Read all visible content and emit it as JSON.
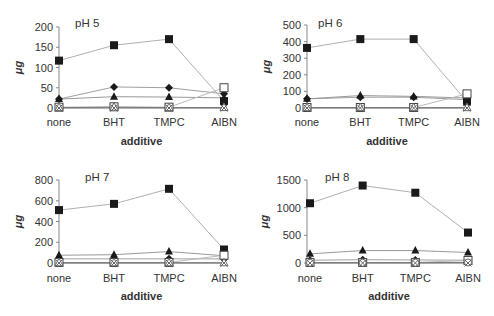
{
  "chart_data": [
    {
      "type": "line",
      "title": "pH 5",
      "xlabel": "additive",
      "ylabel": "μg",
      "categories": [
        "none",
        "BHT",
        "TMPC",
        "AIBN"
      ],
      "yticks": [
        0,
        50,
        100,
        150,
        200
      ],
      "ylim": [
        0,
        200
      ],
      "series": [
        {
          "name": "filled-square",
          "marker": "square-filled",
          "values": [
            117,
            155,
            170,
            17
          ]
        },
        {
          "name": "filled-diamond",
          "marker": "diamond-filled",
          "values": [
            22,
            52,
            50,
            35
          ]
        },
        {
          "name": "filled-triangle",
          "marker": "triangle-filled",
          "values": [
            22,
            28,
            27,
            25
          ]
        },
        {
          "name": "open-square",
          "marker": "square-open",
          "values": [
            2,
            3,
            2,
            50
          ]
        },
        {
          "name": "open-triangle",
          "marker": "triangle-open",
          "values": [
            1,
            2,
            1,
            1
          ]
        },
        {
          "name": "cross",
          "marker": "x",
          "values": [
            0,
            0,
            0,
            0
          ]
        }
      ]
    },
    {
      "type": "line",
      "title": "pH 6",
      "xlabel": "additive",
      "ylabel": "μg",
      "categories": [
        "none",
        "BHT",
        "TMPC",
        "AIBN"
      ],
      "yticks": [
        0,
        100,
        200,
        300,
        400,
        500
      ],
      "ylim": [
        0,
        500
      ],
      "series": [
        {
          "name": "filled-square",
          "marker": "square-filled",
          "values": [
            362,
            415,
            415,
            38
          ]
        },
        {
          "name": "filled-diamond",
          "marker": "diamond-filled",
          "values": [
            55,
            65,
            65,
            50
          ]
        },
        {
          "name": "filled-triangle",
          "marker": "triangle-filled",
          "values": [
            55,
            75,
            70,
            60
          ]
        },
        {
          "name": "open-square",
          "marker": "square-open",
          "values": [
            3,
            3,
            3,
            85
          ]
        },
        {
          "name": "open-triangle",
          "marker": "triangle-open",
          "values": [
            2,
            2,
            2,
            2
          ]
        },
        {
          "name": "cross",
          "marker": "x",
          "values": [
            0,
            0,
            0,
            0
          ]
        }
      ]
    },
    {
      "type": "line",
      "title": "pH 7",
      "xlabel": "additive",
      "ylabel": "μg",
      "categories": [
        "none",
        "BHT",
        "TMPC",
        "AIBN"
      ],
      "yticks": [
        0,
        200,
        400,
        600,
        800
      ],
      "ylim": [
        0,
        800
      ],
      "series": [
        {
          "name": "filled-square",
          "marker": "square-filled",
          "values": [
            510,
            570,
            715,
            130
          ]
        },
        {
          "name": "filled-triangle",
          "marker": "triangle-filled",
          "values": [
            75,
            80,
            110,
            70
          ]
        },
        {
          "name": "filled-diamond",
          "marker": "diamond-filled",
          "values": [
            40,
            40,
            40,
            40
          ]
        },
        {
          "name": "open-square",
          "marker": "square-open",
          "values": [
            5,
            5,
            5,
            75
          ]
        },
        {
          "name": "open-triangle",
          "marker": "triangle-open",
          "values": [
            2,
            2,
            2,
            2
          ]
        },
        {
          "name": "cross",
          "marker": "x",
          "values": [
            0,
            0,
            0,
            0
          ]
        }
      ]
    },
    {
      "type": "line",
      "title": "pH 8",
      "xlabel": "additive",
      "ylabel": "μg",
      "categories": [
        "none",
        "BHT",
        "TMPC",
        "AIBN"
      ],
      "yticks": [
        0,
        500,
        1000,
        1500
      ],
      "ylim": [
        0,
        1500
      ],
      "series": [
        {
          "name": "filled-square",
          "marker": "square-filled",
          "values": [
            1080,
            1400,
            1270,
            550
          ]
        },
        {
          "name": "filled-triangle",
          "marker": "triangle-filled",
          "values": [
            165,
            225,
            225,
            190
          ]
        },
        {
          "name": "filled-diamond",
          "marker": "diamond-filled",
          "values": [
            50,
            60,
            55,
            50
          ]
        },
        {
          "name": "open-square",
          "marker": "square-open",
          "values": [
            10,
            10,
            10,
            45
          ]
        },
        {
          "name": "open-circle",
          "marker": "circle-open",
          "values": [
            5,
            5,
            5,
            10
          ]
        },
        {
          "name": "cross",
          "marker": "x",
          "values": [
            0,
            0,
            0,
            0
          ]
        }
      ]
    }
  ]
}
